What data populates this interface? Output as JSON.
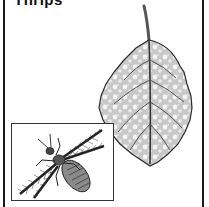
{
  "header": {
    "title": "Thrips"
  },
  "illustration": {
    "main_subject": "leaf-with-thrips-damage",
    "inset_subject": "thrips-insect",
    "colors": {
      "ink": "#1a1a1a",
      "leaf_shade": "#bdbdbd",
      "leaf_highlight": "#f2f2f2",
      "background": "#ffffff"
    }
  }
}
